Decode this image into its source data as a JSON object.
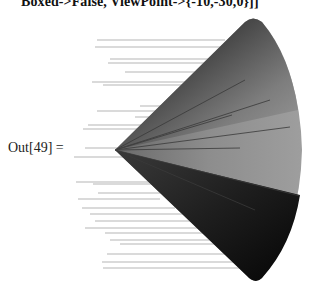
{
  "notebook": {
    "input_tail": "Boxed->False, ViewPoint->{-10,-30,0}]]",
    "output_label": "Out[49] =",
    "graphic": {
      "type": "3D cone",
      "apex": [
        115,
        150
      ],
      "rim_top": [
        253,
        18
      ],
      "rim_right": [
        302,
        150
      ],
      "rim_bottom": [
        258,
        281
      ],
      "colors": {
        "dark_face": "#1a1a1a",
        "mid_face": "#6e6e6e",
        "light_face": "#9a9a9a",
        "streak": "#b8b8b8"
      }
    }
  }
}
